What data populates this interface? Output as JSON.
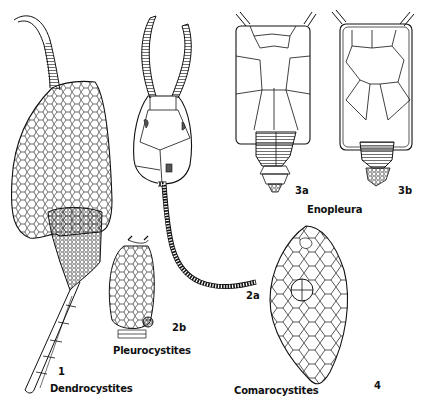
{
  "plate": {
    "figures": [
      {
        "number": "1",
        "genus": "Dendrocystites"
      },
      {
        "number": "2a",
        "genus": "Pleurocystites"
      },
      {
        "number": "2b",
        "genus": "Pleurocystites"
      },
      {
        "number": "3a",
        "genus": "Enopleura"
      },
      {
        "number": "3b",
        "genus": "Enopleura"
      },
      {
        "number": "4",
        "genus": "Comarocystites"
      }
    ],
    "labels": {
      "fig1_num": "1",
      "fig1_name": "Dendrocystites",
      "fig2a_num": "2a",
      "fig2b_num": "2b",
      "fig2_name": "Pleurocystites",
      "fig3a_num": "3a",
      "fig3b_num": "3b",
      "fig3_name": "Enopleura",
      "fig4_num": "4",
      "fig4_name": "Comarocystites"
    },
    "colors": {
      "ink": "#111111",
      "background": "#ffffff"
    }
  }
}
